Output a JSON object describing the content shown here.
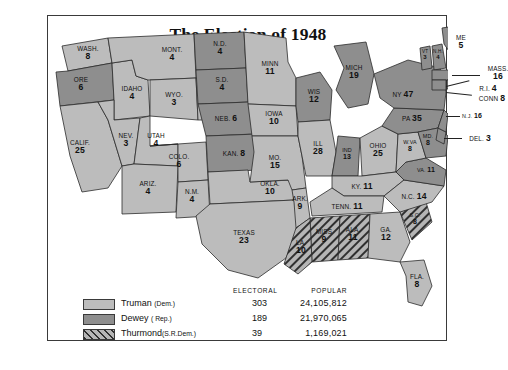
{
  "title": "The Election of 1948",
  "legend": {
    "col_electoral": "ELECTORAL",
    "col_popular": "POPULAR",
    "rows": [
      {
        "name": "Truman",
        "party": "(Dem.)",
        "electoral": "303",
        "popular": "24,105,812",
        "swatch": "truman"
      },
      {
        "name": "Dewey",
        "party": "( Rep.)",
        "electoral": "189",
        "popular": "21,970,065",
        "swatch": "dewey"
      },
      {
        "name": "Thurmond",
        "party": "(S.R.Dem.)",
        "electoral": "39",
        "popular": "1,169,021",
        "swatch": "thurmond"
      }
    ]
  },
  "colors": {
    "truman": "#bcbcbc",
    "dewey": "#8e8e8e",
    "thurmond_hatch": "#2f2f2f",
    "border": "#2b2b2b"
  },
  "states": [
    {
      "abbr": "WASH.",
      "votes": "8",
      "winner": "truman"
    },
    {
      "abbr": "ORE",
      "votes": "6",
      "winner": "dewey"
    },
    {
      "abbr": "CALIF.",
      "votes": "25",
      "winner": "truman"
    },
    {
      "abbr": "IDAHO",
      "votes": "4",
      "winner": "truman"
    },
    {
      "abbr": "NEV.",
      "votes": "3",
      "winner": "truman"
    },
    {
      "abbr": "MONT.",
      "votes": "4",
      "winner": "truman"
    },
    {
      "abbr": "WYO.",
      "votes": "3",
      "winner": "truman"
    },
    {
      "abbr": "UTAH",
      "votes": "4",
      "winner": "truman"
    },
    {
      "abbr": "ARIZ.",
      "votes": "4",
      "winner": "truman"
    },
    {
      "abbr": "COLO.",
      "votes": "6",
      "winner": "truman"
    },
    {
      "abbr": "N.M.",
      "votes": "4",
      "winner": "truman"
    },
    {
      "abbr": "N.D.",
      "votes": "4",
      "winner": "dewey"
    },
    {
      "abbr": "S.D.",
      "votes": "4",
      "winner": "dewey"
    },
    {
      "abbr": "NEB.",
      "votes": "6",
      "winner": "dewey"
    },
    {
      "abbr": "KAN.",
      "votes": "8",
      "winner": "dewey"
    },
    {
      "abbr": "OKLA.",
      "votes": "10",
      "winner": "truman"
    },
    {
      "abbr": "TEXAS",
      "votes": "23",
      "winner": "truman"
    },
    {
      "abbr": "MINN",
      "votes": "11",
      "winner": "truman"
    },
    {
      "abbr": "IOWA",
      "votes": "10",
      "winner": "truman"
    },
    {
      "abbr": "MO.",
      "votes": "15",
      "winner": "truman"
    },
    {
      "abbr": "ARK.",
      "votes": "9",
      "winner": "truman"
    },
    {
      "abbr": "WIS",
      "votes": "12",
      "winner": "dewey"
    },
    {
      "abbr": "ILL",
      "votes": "28",
      "winner": "truman"
    },
    {
      "abbr": "MICH",
      "votes": "19",
      "winner": "dewey"
    },
    {
      "abbr": "IND",
      "votes": "13",
      "winner": "dewey"
    },
    {
      "abbr": "OHIO",
      "votes": "25",
      "winner": "truman"
    },
    {
      "abbr": "KY.",
      "votes": "11",
      "winner": "truman"
    },
    {
      "abbr": "TENN.",
      "votes": "11",
      "winner": "truman"
    },
    {
      "abbr": "MISS",
      "votes": "9",
      "winner": "thurmond"
    },
    {
      "abbr": "ALA.",
      "votes": "11",
      "winner": "thurmond"
    },
    {
      "abbr": "LA.",
      "votes": "10",
      "winner": "thurmond"
    },
    {
      "abbr": "GA.",
      "votes": "12",
      "winner": "truman"
    },
    {
      "abbr": "FLA.",
      "votes": "8",
      "winner": "truman"
    },
    {
      "abbr": "S.C.",
      "votes": "8",
      "winner": "thurmond"
    },
    {
      "abbr": "N.C.",
      "votes": "14",
      "winner": "truman"
    },
    {
      "abbr": "VA.",
      "votes": "11",
      "winner": "dewey"
    },
    {
      "abbr": "W.VA",
      "votes": "8",
      "winner": "truman"
    },
    {
      "abbr": "MD.",
      "votes": "8",
      "winner": "dewey"
    },
    {
      "abbr": "DEL.",
      "votes": "3",
      "winner": "dewey"
    },
    {
      "abbr": "PA",
      "votes": "35",
      "winner": "dewey"
    },
    {
      "abbr": "N.J.",
      "votes": "16",
      "winner": "dewey"
    },
    {
      "abbr": "NY",
      "votes": "47",
      "winner": "dewey"
    },
    {
      "abbr": "CONN",
      "votes": "8",
      "winner": "dewey"
    },
    {
      "abbr": "R.I.",
      "votes": "4",
      "winner": "dewey"
    },
    {
      "abbr": "MASS",
      "votes": "16",
      "winner": "dewey"
    },
    {
      "abbr": "VT",
      "votes": "3",
      "winner": "dewey"
    },
    {
      "abbr": "N.H.",
      "votes": "4",
      "winner": "dewey"
    },
    {
      "abbr": "ME",
      "votes": "5",
      "winner": "dewey"
    }
  ]
}
